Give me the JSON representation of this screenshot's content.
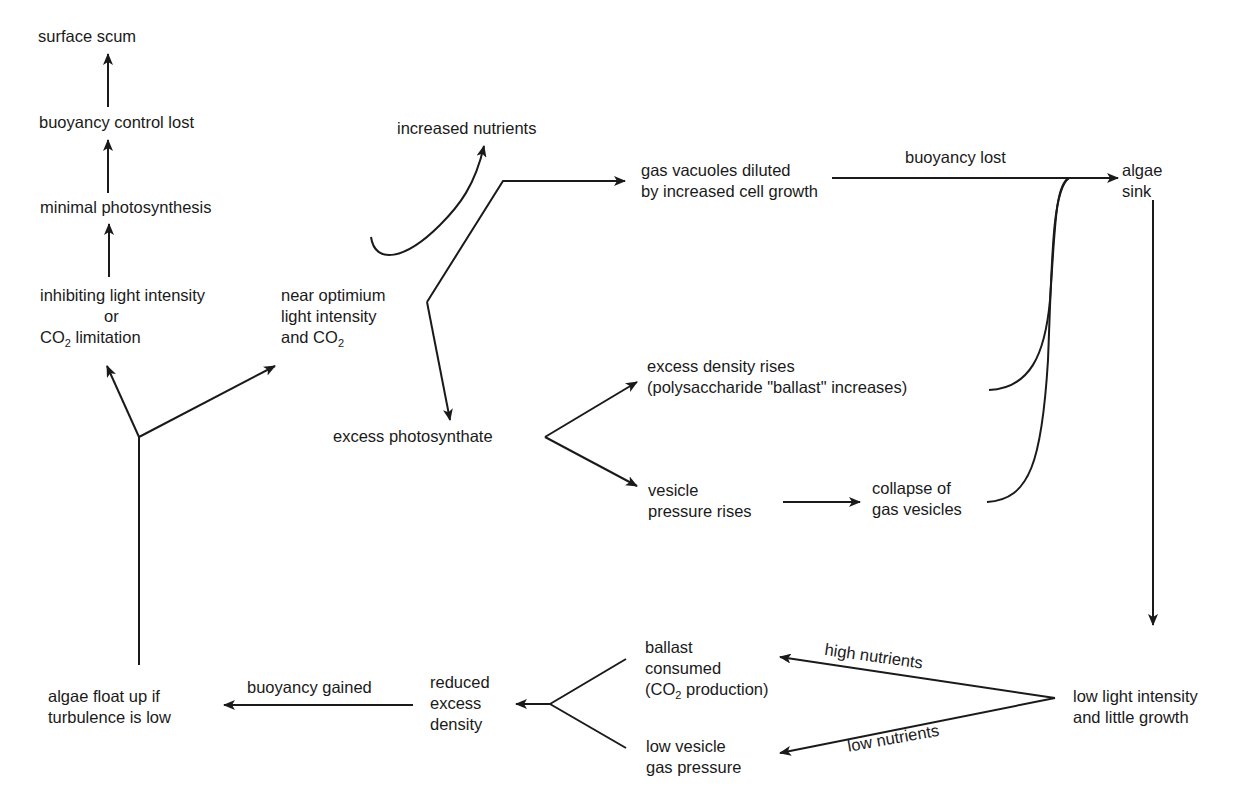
{
  "title": "",
  "nodes": {
    "surface_scum": {
      "lines": [
        "surface scum"
      ]
    },
    "buoyancy_control_lost": {
      "lines": [
        "buoyancy control lost"
      ]
    },
    "minimal_photosynthesis": {
      "lines": [
        "minimal photosynthesis"
      ]
    },
    "inhibiting": {
      "line1": "inhibiting light intensity",
      "line2": "or",
      "line3_pre": "CO",
      "line3_sub": "2",
      "line3_post": " limitation"
    },
    "near_optimum": {
      "line1": "near optimium",
      "line2": "light intensity",
      "line3_pre": "and CO",
      "line3_sub": "2"
    },
    "increased_nutrients": {
      "lines": [
        "increased nutrients"
      ]
    },
    "gas_vacuoles": {
      "lines": [
        "gas vacuoles diluted",
        "by increased cell growth"
      ]
    },
    "algae_sink": {
      "lines": [
        "algae",
        "sink"
      ]
    },
    "excess_photosynthate": {
      "lines": [
        "excess photosynthate"
      ]
    },
    "excess_density": {
      "lines": [
        "excess density rises",
        "(polysaccharide \"ballast\" increases)"
      ]
    },
    "vesicle_pressure": {
      "lines": [
        "vesicle",
        "pressure rises"
      ]
    },
    "collapse": {
      "lines": [
        "collapse of",
        "gas vesicles"
      ]
    },
    "low_light": {
      "lines": [
        "low light intensity",
        "and little growth"
      ]
    },
    "ballast_consumed": {
      "line1": "ballast",
      "line2": "consumed",
      "line3_pre": "(CO",
      "line3_sub": "2",
      "line3_post": " production)"
    },
    "low_vesicle": {
      "lines": [
        "low vesicle",
        "gas pressure"
      ]
    },
    "reduced_density": {
      "lines": [
        "reduced",
        "excess",
        "density"
      ]
    },
    "algae_float": {
      "lines": [
        "algae float up if",
        "turbulence is low"
      ]
    }
  },
  "edge_labels": {
    "buoyancy_lost": "buoyancy lost",
    "buoyancy_gained": "buoyancy gained",
    "high_nutrients": "high nutrients",
    "low_nutrients": "low nutrients"
  },
  "colors": {
    "ink": "#1a1a1a",
    "background": "#ffffff"
  }
}
